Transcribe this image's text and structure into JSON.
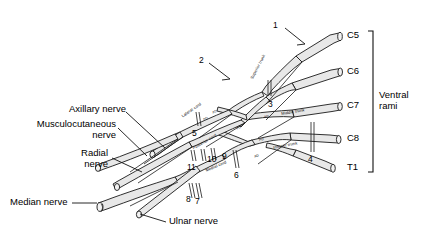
{
  "figure": {
    "type": "anatomical-line-diagram"
  },
  "roots": {
    "bracket_label_line1": "Ventral",
    "bracket_label_line2": "rami",
    "items": [
      {
        "id": "c5",
        "label": "C5"
      },
      {
        "id": "c6",
        "label": "C6"
      },
      {
        "id": "c7",
        "label": "C7"
      },
      {
        "id": "c8",
        "label": "C8"
      },
      {
        "id": "t1",
        "label": "T1"
      }
    ]
  },
  "trunks": [
    {
      "id": "superior-trunk",
      "label": "Superior trunk"
    },
    {
      "id": "middle-trunk",
      "label": "Middle trunk"
    },
    {
      "id": "inferior-trunk",
      "label": "Inferior trunk"
    }
  ],
  "cords": [
    {
      "id": "lateral-cord",
      "label": "Lateral cord"
    },
    {
      "id": "posterior-cord",
      "label": "Posterior cord"
    },
    {
      "id": "medial-cord",
      "label": "Medial cord"
    }
  ],
  "divisions": [
    {
      "id": "ad-1",
      "label": "AD"
    },
    {
      "id": "pd-1",
      "label": "PD"
    },
    {
      "id": "ad-2",
      "label": "AD"
    },
    {
      "id": "pd-2",
      "label": "PD"
    },
    {
      "id": "ad-3",
      "label": "AD"
    },
    {
      "id": "pd-3",
      "label": "PD"
    }
  ],
  "terminal_nerves": [
    {
      "id": "axillary-nerve",
      "label": "Axillary nerve"
    },
    {
      "id": "musculocutaneous-nerve",
      "label_line1": "Musculocutaneous",
      "label_line2": "nerve"
    },
    {
      "id": "radial-nerve",
      "label_line1": "Radial",
      "label_line2": "nerve"
    },
    {
      "id": "median-nerve",
      "label": "Median nerve"
    },
    {
      "id": "ulnar-nerve",
      "label": "Ulnar nerve"
    }
  ],
  "callouts": [
    {
      "id": "callout-1",
      "label": "1"
    },
    {
      "id": "callout-2",
      "label": "2"
    },
    {
      "id": "callout-3",
      "label": "3"
    },
    {
      "id": "callout-4",
      "label": "4"
    },
    {
      "id": "callout-5",
      "label": "5"
    },
    {
      "id": "callout-6",
      "label": "6"
    },
    {
      "id": "callout-7",
      "label": "7"
    },
    {
      "id": "callout-8",
      "label": "8"
    },
    {
      "id": "callout-9",
      "label": "9"
    },
    {
      "id": "callout-10",
      "label": "10"
    },
    {
      "id": "callout-11",
      "label": "11"
    }
  ],
  "colors": {
    "nerve_fill": "#e8e8e8",
    "outline": "#1a1a1a",
    "text": "#000000",
    "background": "#ffffff"
  }
}
